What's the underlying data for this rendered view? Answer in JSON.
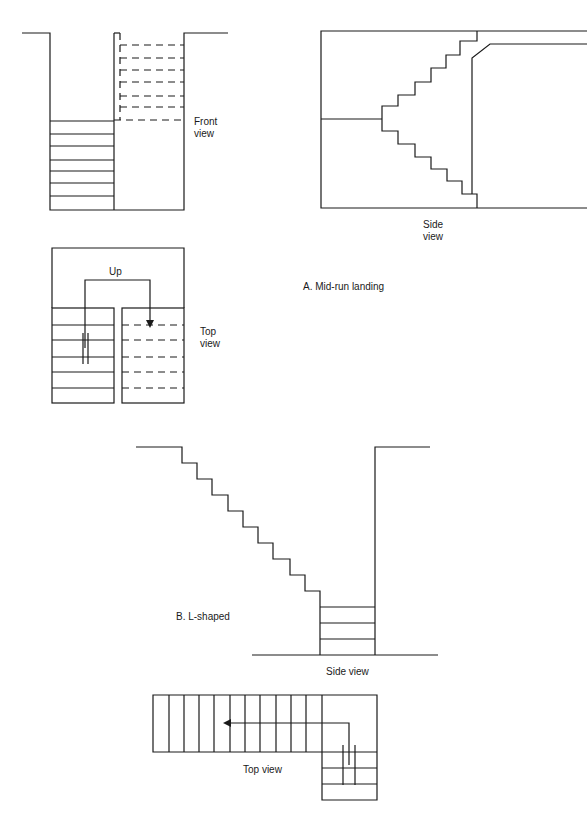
{
  "section_a": {
    "caption": "A. Mid-run landing",
    "front_view": {
      "label_line1": "Front",
      "label_line2": "view"
    },
    "side_view": {
      "label_line1": "Side",
      "label_line2": "view"
    },
    "top_view": {
      "label_line1": "Top",
      "label_line2": "view",
      "arrow_label": "Up"
    }
  },
  "section_b": {
    "caption": "B. L-shaped",
    "side_view": {
      "label": "Side view"
    },
    "top_view": {
      "label": "Top view"
    }
  },
  "colors": {
    "line": "#1a1a1a",
    "background": "#ffffff"
  }
}
